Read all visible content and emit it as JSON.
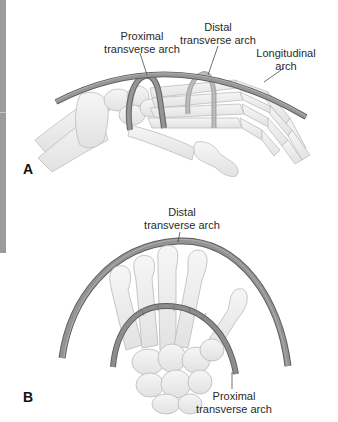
{
  "figure": {
    "panels": [
      {
        "id": "A",
        "letter": "A",
        "view": "lateral",
        "labels": {
          "proximal": {
            "line1": "Proximal",
            "line2": "transverse arch"
          },
          "distal": {
            "line1": "Distal",
            "line2": "transverse arch"
          },
          "longitudinal": {
            "line1": "Longitudinal",
            "line2": "arch"
          }
        }
      },
      {
        "id": "B",
        "letter": "B",
        "view": "end-on",
        "labels": {
          "distal": {
            "line1": "Distal",
            "line2": "transverse arch"
          },
          "proximal": {
            "line1": "Proximal",
            "line2": "transverse arch"
          }
        }
      }
    ],
    "colors": {
      "arch_fill": "#8e8e8e",
      "arch_edge": "#5e5e5e",
      "arch_highlight": "#b8b8b8",
      "bone_fill": "#efefef",
      "bone_edge": "#b9b9b9",
      "side_bar": "#9b9b9b",
      "text": "#2a2a2a"
    }
  }
}
